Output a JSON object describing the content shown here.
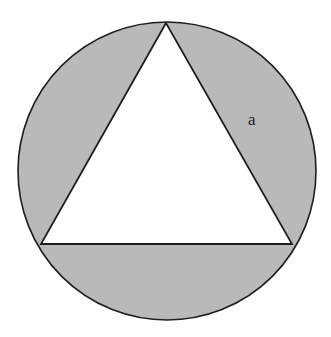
{
  "figure": {
    "colors": {
      "background": "#ffffff",
      "shade": "#b9b9b9",
      "stroke": "#1e1e1e",
      "triangle_fill": "#ffffff"
    },
    "circle": {
      "cx": 167,
      "cy": 171,
      "r": 149
    },
    "triangle": {
      "points": [
        [
          166,
          23
        ],
        [
          41,
          244
        ],
        [
          292,
          244
        ]
      ]
    },
    "labels": [
      {
        "id": "segment-label-a",
        "text": "a",
        "x": 248,
        "y": 125
      }
    ]
  }
}
